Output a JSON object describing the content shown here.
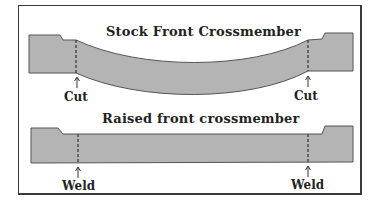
{
  "diagram": {
    "stock": {
      "title": "Stock Front Crossmember",
      "labels": {
        "left": "Cut",
        "right": "Cut"
      }
    },
    "raised": {
      "title": "Raised front crossmember",
      "labels": {
        "left": "Weld",
        "right": "Weld"
      }
    },
    "colors": {
      "fill": "#b4b4b4",
      "stroke": "#555555",
      "border": "#3a3a3a"
    }
  }
}
